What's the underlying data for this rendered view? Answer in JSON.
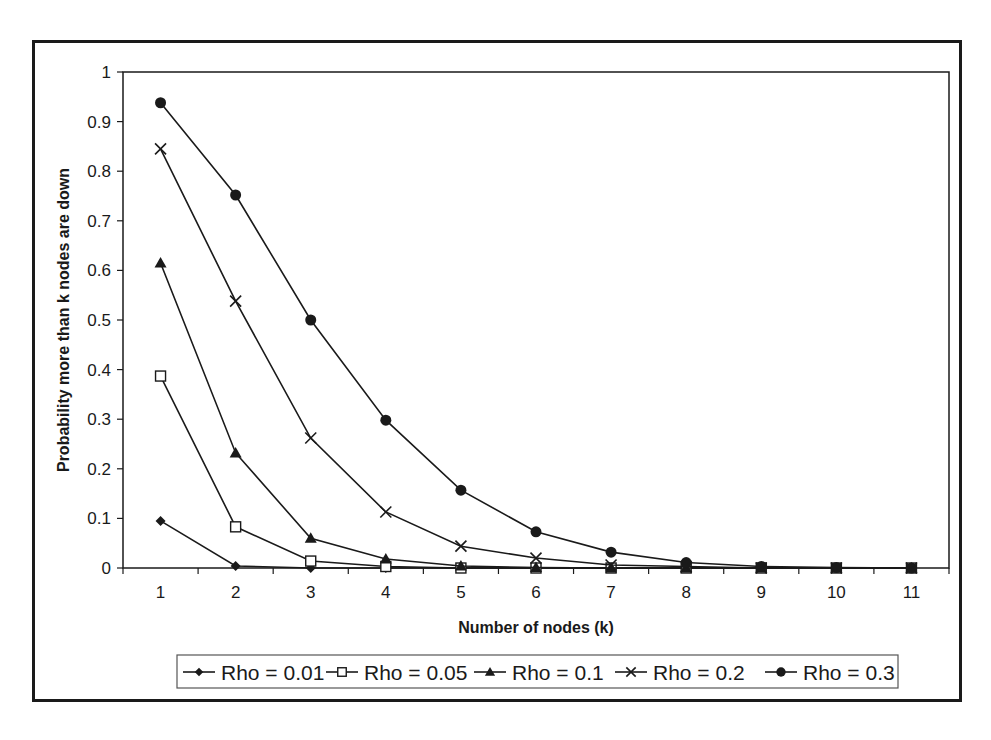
{
  "chart_data": {
    "type": "line",
    "title": "",
    "xlabel": "Number of nodes (k)",
    "ylabel": "Probability more than k nodes are down",
    "categories": [
      "1",
      "2",
      "3",
      "4",
      "5",
      "6",
      "7",
      "8",
      "9",
      "10",
      "11"
    ],
    "ylim": [
      0,
      1
    ],
    "yticks": [
      "0",
      "0.1",
      "0.2",
      "0.3",
      "0.4",
      "0.5",
      "0.6",
      "0.7",
      "0.8",
      "0.9",
      "1"
    ],
    "grid": false,
    "legend_position": "bottom",
    "series": [
      {
        "name": "Rho = 0.01",
        "marker": "diamond",
        "values": [
          0.095,
          0.004,
          0.0,
          0.0,
          0.0,
          0.0,
          0.0,
          0.0,
          0.0,
          0.0,
          0.0
        ]
      },
      {
        "name": "Rho = 0.05",
        "marker": "square-open",
        "values": [
          0.387,
          0.083,
          0.014,
          0.003,
          0.0,
          0.0,
          0.0,
          0.0,
          0.0,
          0.0,
          0.0
        ]
      },
      {
        "name": "Rho = 0.1",
        "marker": "triangle",
        "values": [
          0.615,
          0.232,
          0.06,
          0.018,
          0.004,
          0.001,
          0.0,
          0.0,
          0.0,
          0.0,
          0.0
        ]
      },
      {
        "name": "Rho = 0.2",
        "marker": "x",
        "values": [
          0.845,
          0.538,
          0.262,
          0.113,
          0.044,
          0.02,
          0.006,
          0.003,
          0.0,
          0.0,
          0.0
        ]
      },
      {
        "name": "Rho = 0.3",
        "marker": "circle",
        "values": [
          0.938,
          0.752,
          0.5,
          0.298,
          0.157,
          0.073,
          0.032,
          0.011,
          0.003,
          0.001,
          0.0
        ]
      }
    ]
  },
  "legend": {
    "items": [
      {
        "label": "Rho = 0.01"
      },
      {
        "label": "Rho = 0.05"
      },
      {
        "label": "Rho = 0.1"
      },
      {
        "label": "Rho = 0.2"
      },
      {
        "label": "Rho = 0.3"
      }
    ]
  },
  "colors": {
    "line": "#1a1a1a",
    "background": "#ffffff"
  }
}
